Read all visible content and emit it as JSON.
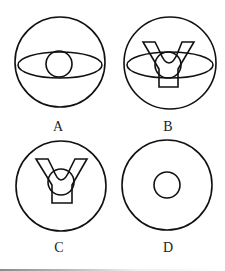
{
  "figure": {
    "stroke_color": "#111111",
    "background_color": "#ffffff",
    "options": [
      {
        "label": "A",
        "elements": [
          "large-circle",
          "horizontal-ellipse",
          "small-circle"
        ]
      },
      {
        "label": "B",
        "elements": [
          "large-circle",
          "horizontal-ellipse",
          "small-circle",
          "y-shape"
        ]
      },
      {
        "label": "C",
        "elements": [
          "large-circle",
          "small-circle",
          "y-shape"
        ]
      },
      {
        "label": "D",
        "elements": [
          "large-circle",
          "small-circle"
        ]
      }
    ]
  }
}
